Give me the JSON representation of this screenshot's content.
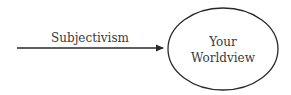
{
  "diagram": {
    "arrow": {
      "label": "Subjectivism",
      "x1": 17,
      "y1": 48,
      "x2": 164,
      "y2": 48,
      "color": "#2a2a2a"
    },
    "node": {
      "line1": "Your",
      "line2": "Worldview",
      "cx": 223,
      "cy": 49,
      "rx": 55,
      "ry": 41,
      "stroke": "#2a2a2a"
    }
  }
}
